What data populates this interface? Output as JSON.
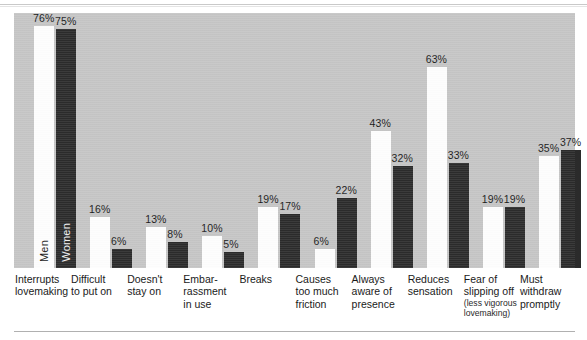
{
  "chart_data": {
    "type": "bar",
    "title": "",
    "subtitle": "",
    "xlabel": "",
    "ylabel": "",
    "ylim": [
      0,
      80
    ],
    "grid": false,
    "legend_position": "in-bar-first-group",
    "value_suffix": "%",
    "categories": [
      "Interrupts\nlovemaking",
      "Difficult\nto put on",
      "Doesn't\nstay on",
      "Embar-\nrassment\nin use",
      "Breaks",
      "Causes\ntoo much\nfriction",
      "Always\naware of\npresence",
      "Reduces\nsensation",
      "Fear of\nslipping off",
      "Must\nwithdraw\npromptly"
    ],
    "category_sublabels": [
      "",
      "",
      "",
      "",
      "",
      "",
      "",
      "",
      "(less vigorous lovemaking)",
      ""
    ],
    "series": [
      {
        "name": "Men",
        "color": "#fdfdfd",
        "values": [
          76,
          16,
          13,
          10,
          19,
          6,
          43,
          63,
          19,
          35
        ],
        "labels": [
          "76%",
          "16%",
          "13%",
          "10%",
          "19%",
          "6%",
          "43%",
          "63%",
          "19%",
          "35%"
        ]
      },
      {
        "name": "Women",
        "color": "#2b2b2b",
        "values": [
          75,
          6,
          8,
          5,
          17,
          22,
          32,
          33,
          19,
          37
        ],
        "labels": [
          "75%",
          "6%",
          "8%",
          "5%",
          "17%",
          "22%",
          "32%",
          "33%",
          "19%",
          "37%"
        ]
      }
    ],
    "plot_background": "#c5c5c5",
    "page_background": "#ffffff"
  },
  "figure": {
    "series_tag_men": "Men",
    "series_tag_women": "Women"
  }
}
